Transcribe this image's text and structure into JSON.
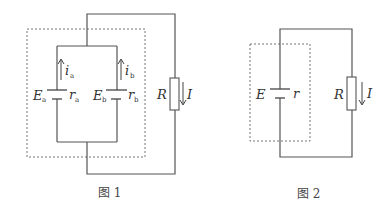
{
  "figures": [
    {
      "caption": "图 1",
      "batteries": [
        {
          "emf_label": "E",
          "emf_sub": "a",
          "r_label": "r",
          "r_sub": "a",
          "current_label": "i",
          "current_sub": "a"
        },
        {
          "emf_label": "E",
          "emf_sub": "b",
          "r_label": "r",
          "r_sub": "b",
          "current_label": "i",
          "current_sub": "b"
        }
      ],
      "resistor": {
        "label": "R",
        "current_label": "I"
      }
    },
    {
      "caption": "图 2",
      "battery": {
        "emf_label": "E",
        "r_label": "r"
      },
      "resistor": {
        "label": "R",
        "current_label": "I"
      }
    }
  ],
  "colors": {
    "line": "#555555",
    "background": "#ffffff"
  }
}
